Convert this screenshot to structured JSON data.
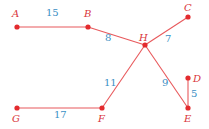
{
  "diagram": {
    "type": "weighted-graph",
    "colors": {
      "edge": "#e8595c",
      "node": "#e32b2e",
      "node_label": "#d9363a",
      "weight_label": "#3a8fc4",
      "background": "#ffffff"
    },
    "nodes": [
      {
        "id": "A",
        "label": "A",
        "x": 17,
        "y": 27,
        "lx": 12,
        "ly": 17
      },
      {
        "id": "B",
        "label": "B",
        "x": 88,
        "y": 27,
        "lx": 84,
        "ly": 17
      },
      {
        "id": "C",
        "label": "C",
        "x": 188,
        "y": 17,
        "lx": 184,
        "ly": 11
      },
      {
        "id": "H",
        "label": "H",
        "x": 145,
        "y": 45,
        "lx": 139,
        "ly": 41
      },
      {
        "id": "D",
        "label": "D",
        "x": 188,
        "y": 78,
        "lx": 193,
        "ly": 82
      },
      {
        "id": "E",
        "label": "E",
        "x": 188,
        "y": 108,
        "lx": 184,
        "ly": 122
      },
      {
        "id": "F",
        "label": "F",
        "x": 102,
        "y": 108,
        "lx": 98,
        "ly": 122
      },
      {
        "id": "G",
        "label": "G",
        "x": 17,
        "y": 108,
        "lx": 12,
        "ly": 122
      }
    ],
    "edges": [
      {
        "from": "A",
        "to": "B",
        "weight": "15",
        "lx": 46,
        "ly": 16
      },
      {
        "from": "B",
        "to": "H",
        "weight": "8",
        "lx": 105,
        "ly": 41
      },
      {
        "from": "H",
        "to": "C",
        "weight": "7",
        "lx": 165,
        "ly": 42
      },
      {
        "from": "H",
        "to": "F",
        "weight": "11",
        "lx": 104,
        "ly": 86
      },
      {
        "from": "H",
        "to": "E",
        "weight": "9",
        "lx": 162,
        "ly": 86
      },
      {
        "from": "D",
        "to": "E",
        "weight": "5",
        "lx": 191,
        "ly": 97
      },
      {
        "from": "G",
        "to": "F",
        "weight": "17",
        "lx": 54,
        "ly": 118
      }
    ]
  }
}
